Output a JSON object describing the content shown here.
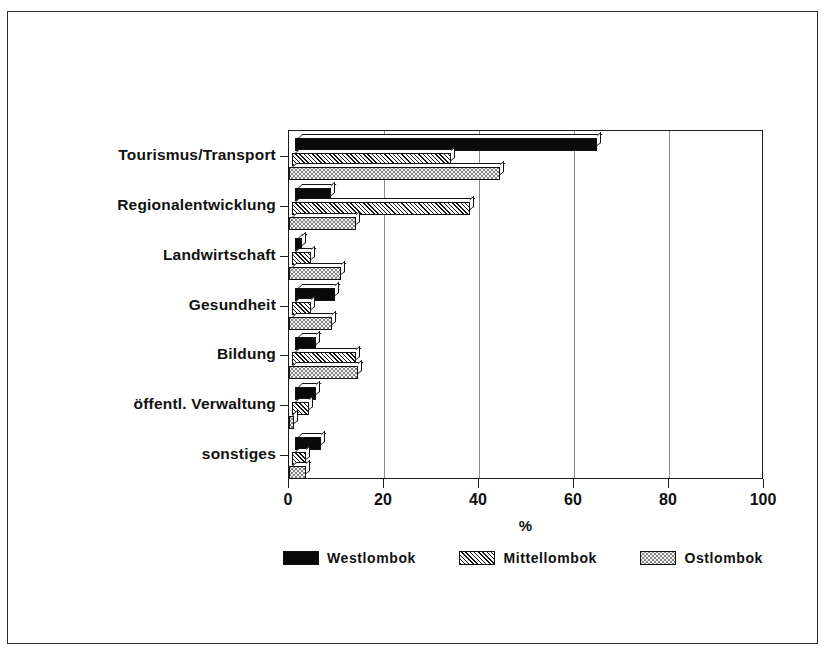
{
  "chart_data": {
    "type": "bar",
    "orientation": "horizontal",
    "title": "",
    "xlabel": "%",
    "ylabel": "",
    "xlim": [
      0,
      100
    ],
    "xticks": [
      0,
      20,
      40,
      60,
      80,
      100
    ],
    "xtick_labels": [
      "0",
      "20",
      "40",
      "60",
      "80",
      "100"
    ],
    "grid": "vertical",
    "legend_position": "bottom",
    "categories": [
      "Tourismus/Transport",
      "Regionalentwicklung",
      "Landwirtschaft",
      "Gesundheit",
      "Bildung",
      "öffentl. Verwaltung",
      "sonstiges"
    ],
    "series": [
      {
        "name": "Westlombok",
        "pattern": "solid-black",
        "values": [
          63.5,
          7.5,
          1.5,
          8.5,
          4.5,
          4.5,
          5.5
        ]
      },
      {
        "name": "Mittellombok",
        "pattern": "diagonal-hatch",
        "values": [
          33.5,
          37.5,
          4.0,
          4.0,
          13.5,
          3.5,
          3.0
        ]
      },
      {
        "name": "Ostlombok",
        "pattern": "light-dots",
        "values": [
          44.5,
          14.0,
          11.0,
          9.0,
          14.5,
          1.0,
          3.5
        ]
      }
    ]
  },
  "legend": {
    "items": [
      {
        "label": "Westlombok",
        "pattern": "solid-black"
      },
      {
        "label": "Mittellombok",
        "pattern": "diagonal-hatch"
      },
      {
        "label": "Ostlombok",
        "pattern": "light-dots"
      }
    ]
  },
  "colors": {
    "frame": "#1a1a1a",
    "grid": "#8d8d8d",
    "series_west": "#0a0a0a",
    "series_mittel": "#ffffff",
    "series_ost": "#f2f2f2",
    "text": "#111111",
    "background": "#ffffff"
  }
}
